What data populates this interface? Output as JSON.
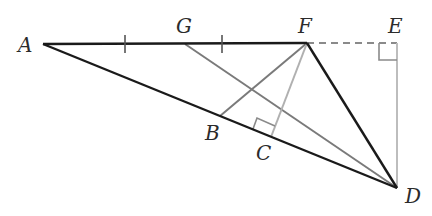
{
  "diagram": {
    "type": "geometry",
    "points": {
      "A": {
        "label": "A",
        "x": 43,
        "y": 44
      },
      "G": {
        "label": "G",
        "x": 185,
        "y": 44
      },
      "F": {
        "label": "F",
        "x": 307,
        "y": 43
      },
      "E": {
        "label": "E",
        "x": 397,
        "y": 43
      },
      "D": {
        "label": "D",
        "x": 397,
        "y": 188
      },
      "B": {
        "label": "B",
        "x": 220,
        "y": 116
      },
      "C": {
        "label": "C",
        "x": 262,
        "y": 133
      }
    },
    "segments": [
      {
        "from": "A",
        "to": "F",
        "style": "solid",
        "color": "#1a1a1a"
      },
      {
        "from": "A",
        "to": "D",
        "style": "solid",
        "color": "#1a1a1a"
      },
      {
        "from": "F",
        "to": "D",
        "style": "solid",
        "color": "#1a1a1a"
      },
      {
        "from": "F",
        "to": "E",
        "style": "dashed",
        "color": "#8a8a8a"
      },
      {
        "from": "E",
        "to": "D",
        "style": "solid",
        "color": "#bdbdbd"
      },
      {
        "from": "G",
        "to": "D",
        "style": "solid",
        "color": "#7a7a7a"
      },
      {
        "from": "F",
        "to": "B",
        "style": "solid",
        "color": "#7a7a7a"
      },
      {
        "from": "F",
        "to": "C",
        "style": "solid",
        "color": "#b0b0b0"
      }
    ],
    "tick_marks": [
      {
        "segment": "AG",
        "x": 125,
        "y": 44
      },
      {
        "segment": "GF",
        "x": 222,
        "y": 44
      }
    ],
    "right_angles": [
      "E",
      "C"
    ]
  }
}
